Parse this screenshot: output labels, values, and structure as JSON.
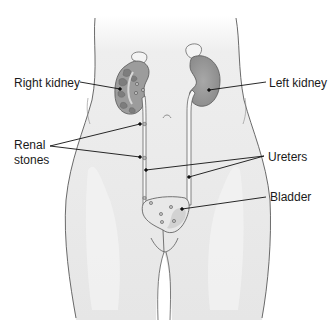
{
  "diagram": {
    "colors": {
      "body_fill": "#e9e9e9",
      "body_outline": "#5a5a5a",
      "kidney_fill": "#9a9a9a",
      "kidney_dark": "#777777",
      "adrenal_fill": "#f2f2f2",
      "ureter_fill": "#f5f5f5",
      "bladder_fill": "#e6e6e6",
      "leader_line": "#111111",
      "text": "#1a1a1a"
    },
    "labels": {
      "right_kidney": "Right kidney",
      "left_kidney": "Left kidney",
      "renal_stones_line1": "Renal",
      "renal_stones_line2": "stones",
      "ureters": "Ureters",
      "bladder": "Bladder"
    }
  }
}
